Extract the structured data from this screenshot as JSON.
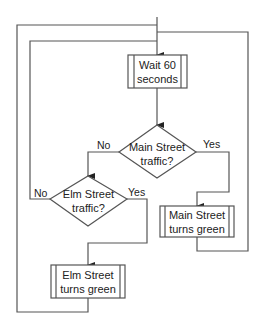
{
  "diagram": {
    "type": "flowchart",
    "nodes": [
      {
        "id": "wait",
        "shape": "predefined-process",
        "lines": [
          "Wait 60",
          "seconds"
        ]
      },
      {
        "id": "main_q",
        "shape": "decision",
        "lines": [
          "Main Street",
          "traffic?"
        ]
      },
      {
        "id": "elm_q",
        "shape": "decision",
        "lines": [
          "Elm Street",
          "traffic?"
        ]
      },
      {
        "id": "main_green",
        "shape": "predefined-process",
        "lines": [
          "Main Street",
          "turns green"
        ]
      },
      {
        "id": "elm_green",
        "shape": "predefined-process",
        "lines": [
          "Elm Street",
          "turns green"
        ]
      }
    ],
    "edges": [
      {
        "from": "start",
        "to": "wait"
      },
      {
        "from": "wait",
        "to": "main_q"
      },
      {
        "from": "main_q",
        "to": "elm_q",
        "label": "No"
      },
      {
        "from": "main_q",
        "to": "main_green",
        "label": "Yes"
      },
      {
        "from": "elm_q",
        "to": "wait",
        "label": "No"
      },
      {
        "from": "elm_q",
        "to": "elm_green",
        "label": "Yes"
      },
      {
        "from": "main_green",
        "to": "wait"
      },
      {
        "from": "elm_green",
        "to": "wait"
      }
    ],
    "labels": {
      "main_no": "No",
      "main_yes": "Yes",
      "elm_no": "No",
      "elm_yes": "Yes"
    }
  }
}
